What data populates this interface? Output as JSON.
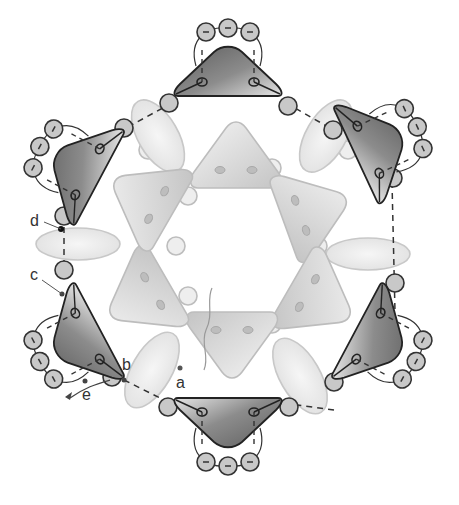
{
  "diagram": {
    "type": "beadwork-stitch-diagram",
    "center": [
      248,
      260
    ],
    "labels": {
      "a": "a",
      "b": "b",
      "c": "c",
      "d": "d",
      "e": "e"
    },
    "components": {
      "outer_triangle_beads": 6,
      "oval_beads": 6,
      "inner_triangle_beads": 6,
      "inner_seed_beads": 12,
      "picot_seed_beads_per_triangle": 3,
      "connector_seed_beads": 12
    },
    "colors": {
      "outer_triangle": "#7a7a7a",
      "outer_triangle_highlight": "#d8d8d8",
      "inner_triangle": "#d9d9d9",
      "oval": "#ececec",
      "seed_bead": "#c8c8c8",
      "thread": "#333333",
      "light_outline": "#bdbdbd"
    }
  }
}
